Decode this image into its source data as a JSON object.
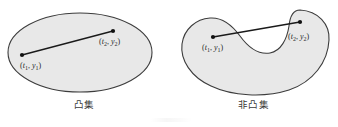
{
  "figure": {
    "background_color": "#ffffff",
    "shape_fill_color": "#e8e8e8",
    "shape_stroke_color": "#3c3c3c",
    "segment_color": "#1a1a1a",
    "point_color": "#111111",
    "panels": [
      {
        "id": "convex",
        "caption": "凸集",
        "shape_type": "ellipse",
        "points": [
          {
            "label_parts": {
              "open": "(",
              "var1": "t",
              "sub1": "1",
              "comma": ", ",
              "var2": "y",
              "sub2": "1",
              "close": ")"
            },
            "label_text": "(t1, y1)",
            "x": 22,
            "y": 55
          },
          {
            "label_parts": {
              "open": "(",
              "var1": "t",
              "sub1": "2",
              "comma": ", ",
              "var2": "y",
              "sub2": "2",
              "close": ")"
            },
            "label_text": "(t2, y2)",
            "x": 113,
            "y": 31
          }
        ],
        "segment_inside_shape": true
      },
      {
        "id": "nonconvex",
        "caption": "非凸集",
        "shape_type": "kidney",
        "points": [
          {
            "label_parts": {
              "open": "(",
              "var1": "t",
              "sub1": "1",
              "comma": ", ",
              "var2": "y",
              "sub2": "1",
              "close": ")"
            },
            "label_text": "(t1, y1)",
            "x": 213,
            "y": 37
          },
          {
            "label_parts": {
              "open": "(",
              "var1": "t",
              "sub1": "2",
              "comma": ", ",
              "var2": "y",
              "sub2": "2",
              "close": ")"
            },
            "label_text": "(t2, y2)",
            "x": 300,
            "y": 22
          }
        ],
        "segment_inside_shape": false
      }
    ]
  }
}
